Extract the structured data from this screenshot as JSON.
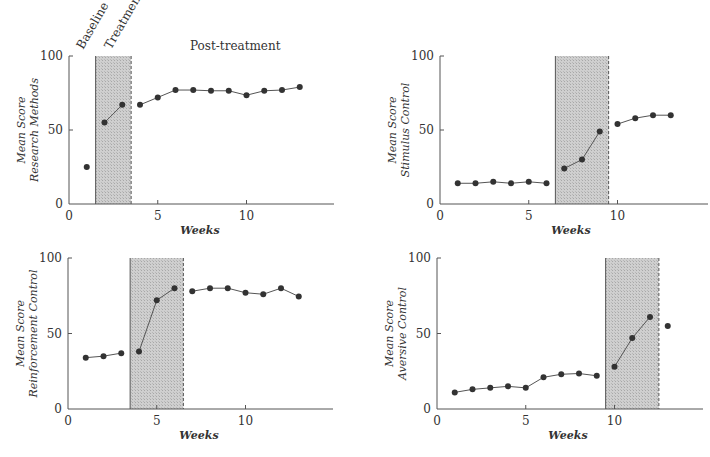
{
  "figure": {
    "phase_labels": {
      "baseline": "Baseline",
      "treatment": "Treatment",
      "post_treatment": "Post-treatment"
    },
    "x_axis_label": "Weeks",
    "y_axis_line1": "Mean Score"
  },
  "chart_data": [
    {
      "type": "line",
      "title": "",
      "xlabel": "Weeks",
      "ylabel": "Mean Score Research Methods",
      "xlim": [
        0,
        14.7
      ],
      "ylim": [
        0,
        100
      ],
      "xticks": [
        0,
        5,
        10
      ],
      "yticks": [
        0,
        50,
        100
      ],
      "grid": false,
      "treatment_phase": [
        1.5,
        3.5
      ],
      "segments": [
        [
          1
        ],
        [
          2,
          3
        ],
        [
          4,
          5,
          6,
          7,
          8,
          9,
          10,
          11,
          12,
          13
        ]
      ],
      "x": [
        1,
        2,
        3,
        4,
        5,
        6,
        7,
        8,
        9,
        10,
        11,
        12,
        13
      ],
      "values": [
        25,
        55,
        67,
        67,
        72,
        77,
        77,
        76.5,
        76.5,
        73.5,
        76.5,
        77,
        79
      ]
    },
    {
      "type": "line",
      "title": "",
      "xlabel": "Weeks",
      "ylabel": "Mean Score Stimulus Control",
      "xlim": [
        0,
        14.7
      ],
      "ylim": [
        0,
        100
      ],
      "xticks": [
        0,
        5,
        10
      ],
      "yticks": [
        0,
        50,
        100
      ],
      "grid": false,
      "treatment_phase": [
        6.5,
        9.5
      ],
      "segments": [
        [
          1,
          2,
          3,
          4,
          5,
          6
        ],
        [
          7,
          8,
          9
        ],
        [
          10,
          11,
          12,
          13
        ]
      ],
      "x": [
        1,
        2,
        3,
        4,
        5,
        6,
        7,
        8,
        9,
        10,
        11,
        12,
        13
      ],
      "values": [
        14,
        14,
        15,
        14,
        15,
        14,
        24,
        30,
        49,
        54,
        58,
        60,
        60
      ]
    },
    {
      "type": "line",
      "title": "",
      "xlabel": "Weeks",
      "ylabel": "Mean Score Reinforcement Control",
      "xlim": [
        0,
        14.7
      ],
      "ylim": [
        0,
        100
      ],
      "xticks": [
        0,
        5,
        10
      ],
      "yticks": [
        0,
        50,
        100
      ],
      "grid": false,
      "treatment_phase": [
        3.5,
        6.5
      ],
      "segments": [
        [
          1,
          2,
          3
        ],
        [
          4,
          5,
          6
        ],
        [
          7,
          8,
          9,
          10,
          11,
          12,
          13
        ]
      ],
      "x": [
        1,
        2,
        3,
        4,
        5,
        6,
        7,
        8,
        9,
        10,
        11,
        12,
        13
      ],
      "values": [
        34,
        35,
        37,
        38,
        72,
        80,
        78,
        80,
        80,
        77,
        76,
        80,
        74.5
      ]
    },
    {
      "type": "line",
      "title": "",
      "xlabel": "Weeks",
      "ylabel": "Mean Score Aversive Control",
      "xlim": [
        0,
        14.7
      ],
      "ylim": [
        0,
        100
      ],
      "xticks": [
        0,
        5,
        10
      ],
      "yticks": [
        0,
        50,
        100
      ],
      "grid": false,
      "treatment_phase": [
        9.5,
        12.5
      ],
      "segments": [
        [
          1,
          2,
          3,
          4,
          5,
          6,
          7,
          8,
          9
        ],
        [
          10,
          11,
          12
        ],
        [
          13
        ]
      ],
      "x": [
        1,
        2,
        3,
        4,
        5,
        6,
        7,
        8,
        9,
        10,
        11,
        12,
        13
      ],
      "values": [
        11,
        13,
        14,
        15,
        14,
        21,
        23,
        23.5,
        22,
        28,
        47,
        61,
        55
      ]
    }
  ],
  "panels": [
    {
      "y_line2": "Research Methods"
    },
    {
      "y_line2": "Stimulus Control"
    },
    {
      "y_line2": "Reinforcement Control"
    },
    {
      "y_line2": "Aversive Control"
    }
  ]
}
